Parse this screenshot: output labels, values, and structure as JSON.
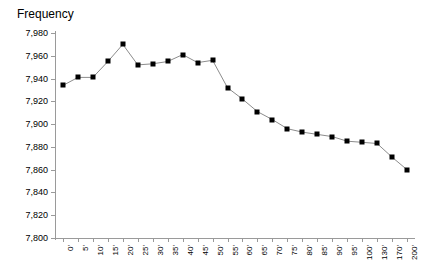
{
  "chart_data": {
    "type": "line",
    "title": "Frequency",
    "xlabel": "",
    "ylabel": "",
    "ylim": [
      7800,
      7980
    ],
    "yticks": [
      "7,800",
      "7,820",
      "7,840",
      "7,860",
      "7,880",
      "7,900",
      "7,920",
      "7,940",
      "7,960",
      "7,980"
    ],
    "ytick_values": [
      7800,
      7820,
      7840,
      7860,
      7880,
      7900,
      7920,
      7940,
      7960,
      7980
    ],
    "grid": false,
    "legend": "none",
    "marker": "square",
    "categories": [
      "0'",
      "5'",
      "10'",
      "15'",
      "20'",
      "25'",
      "30'",
      "35'",
      "40'",
      "45'",
      "50'",
      "55'",
      "60'",
      "65'",
      "70'",
      "75'",
      "80'",
      "85'",
      "90'",
      "95'",
      "100'",
      "130'",
      "170'",
      "200'"
    ],
    "values": [
      7934,
      7941,
      7941,
      7955,
      7970,
      7952,
      7953,
      7955,
      7961,
      7954,
      7956,
      7932,
      7922,
      7911,
      7904,
      7896,
      7893,
      7891,
      7889,
      7885,
      7884,
      7883,
      7871,
      7860
    ],
    "series": [
      {
        "name": "Frequency",
        "color": "#000000",
        "values": [
          7934,
          7941,
          7941,
          7955,
          7970,
          7952,
          7953,
          7955,
          7961,
          7954,
          7956,
          7932,
          7922,
          7911,
          7904,
          7896,
          7893,
          7891,
          7889,
          7885,
          7884,
          7883,
          7871,
          7860
        ]
      }
    ]
  },
  "colors": {
    "line": "#8c8c8c",
    "marker": "#000000",
    "axis": "#9a9a9a",
    "text": "#000000",
    "background": "#ffffff"
  }
}
